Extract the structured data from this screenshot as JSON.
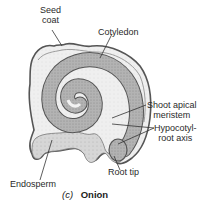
{
  "figure": {
    "part_label": "(c)",
    "title": "Onion",
    "labels": {
      "seed_coat_line1": "Seed",
      "seed_coat_line2": "coat",
      "cotyledon": "Cotyledon",
      "shoot_apical_line1": "Shoot apical",
      "shoot_apical_line2": "meristem",
      "hypocotyl_line1": "Hypocotyl-",
      "hypocotyl_line2": "root axis",
      "root_tip": "Root tip",
      "endosperm": "Endosperm"
    },
    "colors": {
      "outline": "#555555",
      "embryo_fill": "#a8a8a8",
      "endosperm_fill": "#ececec",
      "band_fill": "#c8c8c8",
      "leader": "#333333"
    }
  }
}
